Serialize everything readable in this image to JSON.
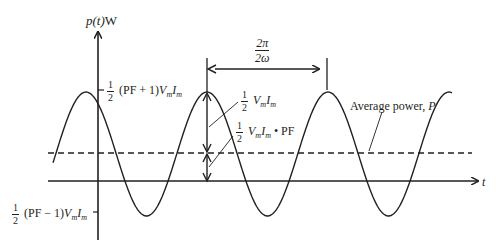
{
  "diagram": {
    "y_axis_label": {
      "pre": "p",
      "paren": "(t)",
      "unit": "W"
    },
    "x_axis_label": "t",
    "max_label": {
      "num": "1",
      "den": "2",
      "expr": "(PF + 1)",
      "v": "V",
      "vsub": "m",
      "i": "I",
      "isub": "m"
    },
    "min_label": {
      "num": "1",
      "den": "2",
      "expr": "(PF − 1)",
      "v": "V",
      "vsub": "m",
      "i": "I",
      "isub": "m"
    },
    "amplitude_label": {
      "num": "1",
      "den": "2",
      "v": "V",
      "vsub": "m",
      "i": "I",
      "isub": "m"
    },
    "avg_offset_label": {
      "num": "1",
      "den": "2",
      "v": "V",
      "vsub": "m",
      "i": "I",
      "isub": "m",
      "suffix": "• PF"
    },
    "period_label": {
      "num": "2π",
      "den": "2ω"
    },
    "average_label": {
      "text": "Average power, ",
      "sym": "P"
    },
    "colors": {
      "ink": "#231f20",
      "background": "#ffffff"
    },
    "geometry": {
      "t_axis_y": 181,
      "avg_y": 153,
      "peak_y": 92,
      "trough_y": 216,
      "y_axis_x": 98,
      "period_px": 121,
      "first_peak_x": 86
    }
  }
}
